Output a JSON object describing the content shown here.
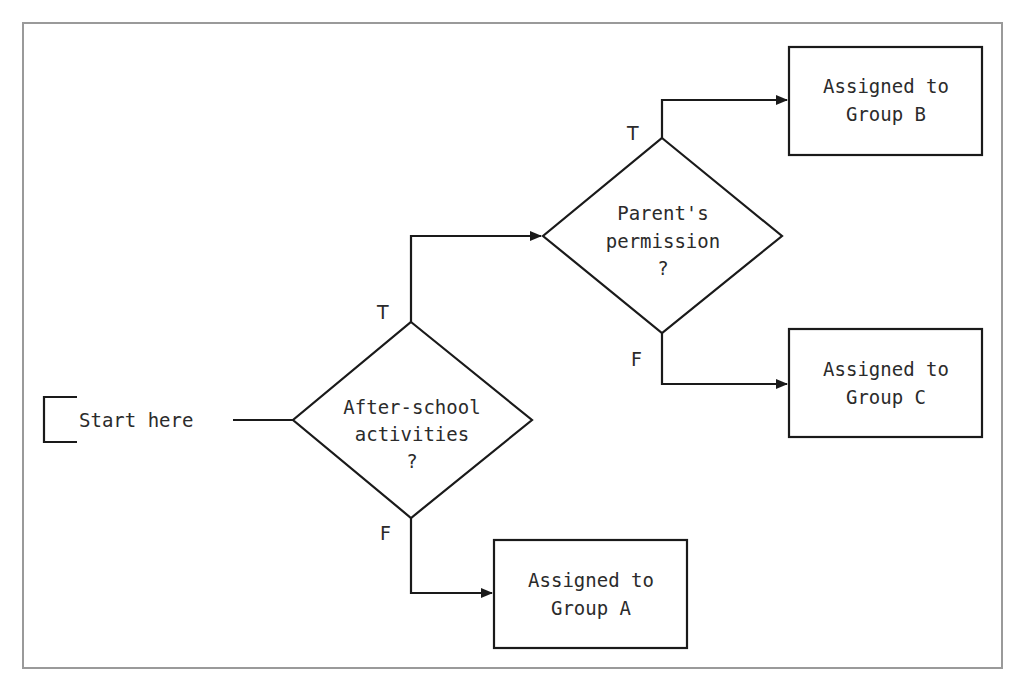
{
  "diagram": {
    "type": "flowchart",
    "start": {
      "label": "Start here"
    },
    "decisions": [
      {
        "id": "d1",
        "lines": [
          "After-school",
          "activities",
          "?"
        ]
      },
      {
        "id": "d2",
        "lines": [
          "Parent's",
          "permission",
          "?"
        ]
      }
    ],
    "outcomes": [
      {
        "id": "a",
        "lines": [
          "Assigned to",
          "Group A"
        ]
      },
      {
        "id": "b",
        "lines": [
          "Assigned to",
          "Group B"
        ]
      },
      {
        "id": "c",
        "lines": [
          "Assigned to",
          "Group C"
        ]
      }
    ],
    "edges": [
      {
        "from": "start",
        "to": "d1",
        "label": ""
      },
      {
        "from": "d1",
        "to": "d2",
        "label": "T"
      },
      {
        "from": "d1",
        "to": "a",
        "label": "F"
      },
      {
        "from": "d2",
        "to": "b",
        "label": "T"
      },
      {
        "from": "d2",
        "to": "c",
        "label": "F"
      }
    ],
    "colors": {
      "stroke": "#1a1a1a",
      "frame": "#9a9a9a",
      "text": "#2b2b2b",
      "background": "#ffffff"
    }
  }
}
